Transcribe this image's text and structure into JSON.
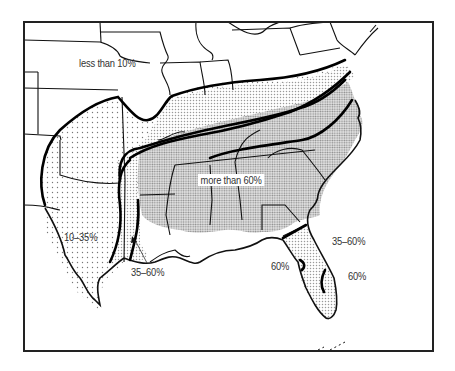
{
  "map": {
    "region": "Southeastern United States",
    "frame_color": "#222222",
    "zones": [
      {
        "id": "z1",
        "label": "less than 10%",
        "pattern": "none"
      },
      {
        "id": "z2",
        "label": "10–35%",
        "pattern": "sparse-dots"
      },
      {
        "id": "z3",
        "label": "35–60%",
        "pattern": "light-dots"
      },
      {
        "id": "z4",
        "label": "more than 60%",
        "pattern": "dense-dots"
      }
    ],
    "labels": {
      "less_than_10": "less than 10%",
      "ten_to_35": "10–35%",
      "thirtyfive_to_60_gulf": "35–60%",
      "more_than_60": "more than 60%",
      "thirtyfive_to_60_atlantic": "35–60%",
      "sixty_west_florida": "60%",
      "sixty_east_florida": "60%"
    }
  }
}
